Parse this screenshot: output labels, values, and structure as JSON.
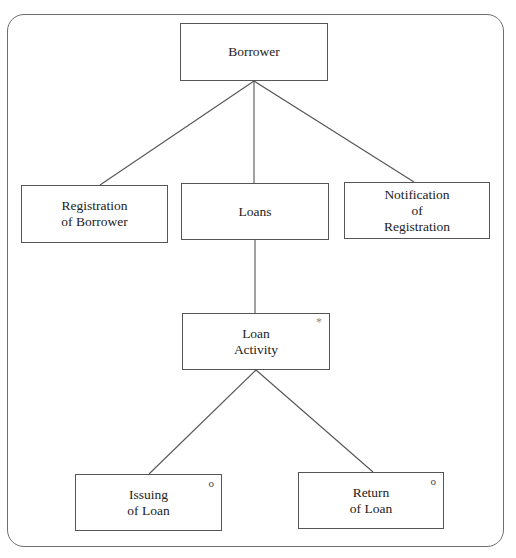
{
  "diagram": {
    "type": "jackson-structure-diagram",
    "nodes": {
      "borrower": {
        "lines": [
          "Borrower"
        ],
        "marker": ""
      },
      "registration": {
        "lines": [
          "Registration",
          "of Borrower"
        ],
        "marker": ""
      },
      "loans": {
        "lines": [
          "Loans"
        ],
        "marker": ""
      },
      "notification": {
        "lines": [
          "Notification",
          "of",
          "Registration"
        ],
        "marker": ""
      },
      "loan_activity": {
        "lines": [
          "Loan",
          "Activity"
        ],
        "marker": "*"
      },
      "issuing": {
        "lines": [
          "Issuing",
          "of Loan"
        ],
        "marker": "o"
      },
      "return": {
        "lines": [
          "Return",
          "of Loan"
        ],
        "marker": "o"
      }
    },
    "edges": [
      {
        "from": "Borrower",
        "to": "Registration of Borrower"
      },
      {
        "from": "Borrower",
        "to": "Loans"
      },
      {
        "from": "Borrower",
        "to": "Notification of Registration"
      },
      {
        "from": "Loans",
        "to": "Loan Activity"
      },
      {
        "from": "Loan Activity",
        "to": "Issuing of Loan"
      },
      {
        "from": "Loan Activity",
        "to": "Return of Loan"
      }
    ],
    "colors": {
      "line": "#555555",
      "frame": "#6e6e6e",
      "background": "#ffffff"
    }
  }
}
